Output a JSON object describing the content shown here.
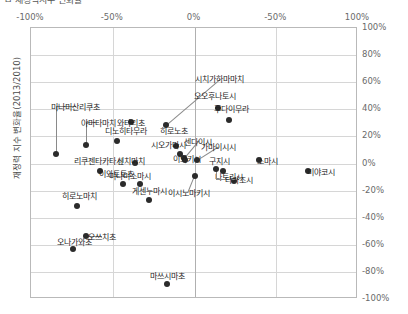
{
  "header": {
    "cut_title": "ㅁ  재정력지수 변화율"
  },
  "axes": {
    "y_title": "재정력 지수 변화율(2013/2010)",
    "x_ticks": [
      "-100%",
      "-50%",
      "0%",
      "-50%",
      "100%"
    ],
    "y_ticks": [
      "100%",
      "80%",
      "60%",
      "40%",
      "20%",
      "0%",
      "-20%",
      "-40%",
      "-60%",
      "-80%",
      "-100%"
    ]
  },
  "chart_data": {
    "type": "scatter",
    "title": "재정력지수 변화율",
    "xlabel": "",
    "ylabel": "재정력 지수 변화율(2013/2010)",
    "xlim": [
      -100,
      100
    ],
    "ylim": [
      -100,
      100
    ],
    "x_ticklabels": [
      "-100%",
      "-50%",
      "0%",
      "-50%",
      "100%"
    ],
    "y_ticklabels": [
      "100%",
      "80%",
      "60%",
      "40%",
      "20%",
      "0%",
      "-20%",
      "-40%",
      "-60%",
      "-80%",
      "-100%"
    ],
    "grid": true,
    "legend": "none",
    "points": [
      {
        "label": "미나미산리쿠초",
        "x": -84,
        "y": 6,
        "lx": -72,
        "ly": 42,
        "leader": "elbow-left"
      },
      {
        "label": "야마다마치",
        "x": -66,
        "y": 13,
        "lx": -58,
        "ly": 30,
        "leader": "elbow-left"
      },
      {
        "label": "와타리초",
        "x": -38,
        "y": 30,
        "lx": -38,
        "ly": 30,
        "leader": "none"
      },
      {
        "label": "디노히타무라",
        "x": -47,
        "y": 16,
        "lx": -41,
        "ly": 24,
        "leader": "none"
      },
      {
        "label": "히로노초",
        "x": -11,
        "y": 12,
        "lx": -12,
        "ly": 24,
        "leader": "none"
      },
      {
        "label": "시오가마시",
        "x": -8,
        "y": 6,
        "lx": -15,
        "ly": 14,
        "leader": "none"
      },
      {
        "label": "시치가하마마치",
        "x": -17,
        "y": 28,
        "lx": 16,
        "ly": 62,
        "leader": "diag"
      },
      {
        "label": "오오후나토시",
        "x": 15,
        "y": 40,
        "lx": 13,
        "ly": 50,
        "leader": "none"
      },
      {
        "label": "후다이무라",
        "x": 22,
        "y": 31,
        "lx": 23,
        "ly": 40,
        "leader": "none"
      },
      {
        "label": "센다이시",
        "x": -6,
        "y": 3,
        "lx": 3,
        "ly": 16,
        "leader": "diag2"
      },
      {
        "label": "이와키시",
        "x": -5,
        "y": 2,
        "lx": -4,
        "ly": 3,
        "leader": "none"
      },
      {
        "label": "가마이시시",
        "x": 2,
        "y": 2,
        "lx": 15,
        "ly": 12,
        "leader": "diag3"
      },
      {
        "label": "구지시",
        "x": 18,
        "y": -6,
        "lx": 16,
        "ly": 2,
        "leader": "none"
      },
      {
        "label": "소마시",
        "x": 40,
        "y": 2,
        "lx": 45,
        "ly": 2,
        "leader": "none"
      },
      {
        "label": "미야코시",
        "x": 70,
        "y": -6,
        "lx": 78,
        "ly": -6,
        "leader": "none"
      },
      {
        "label": "나토리시",
        "x": 25,
        "y": -14,
        "lx": 22,
        "ly": -10,
        "leader": "none"
      },
      {
        "label": "타가조시",
        "x": 14,
        "y": -5,
        "lx": 28,
        "ly": -12,
        "leader": "elbow-right"
      },
      {
        "label": "신치마치",
        "x": -36,
        "y": 0,
        "lx": -38,
        "ly": 2,
        "leader": "none"
      },
      {
        "label": "리쿠젠타카타시",
        "x": -57,
        "y": -6,
        "lx": -58,
        "ly": 2,
        "leader": "none"
      },
      {
        "label": "미나미소마시",
        "x": -33,
        "y": -16,
        "lx": -39,
        "ly": -9,
        "leader": "none"
      },
      {
        "label": "이와토토초",
        "x": -43,
        "y": -16,
        "lx": -47,
        "ly": -8,
        "leader": "none"
      },
      {
        "label": "이시노마키시",
        "x": 1,
        "y": -10,
        "lx": -3,
        "ly": -22,
        "leader": "diag4"
      },
      {
        "label": "게센누마시",
        "x": -27,
        "y": -28,
        "lx": -27,
        "ly": -20,
        "leader": "none"
      },
      {
        "label": "히로노마치",
        "x": -71,
        "y": -32,
        "lx": -70,
        "ly": -24,
        "leader": "none"
      },
      {
        "label": "오쓰치초",
        "x": -66,
        "y": -54,
        "lx": -56,
        "ly": -54,
        "leader": "dash"
      },
      {
        "label": "오나가와초",
        "x": -74,
        "y": -64,
        "lx": -73,
        "ly": -58,
        "leader": "none"
      },
      {
        "label": "마쓰시마초",
        "x": -16,
        "y": -90,
        "lx": -16,
        "ly": -83,
        "leader": "none"
      }
    ]
  }
}
